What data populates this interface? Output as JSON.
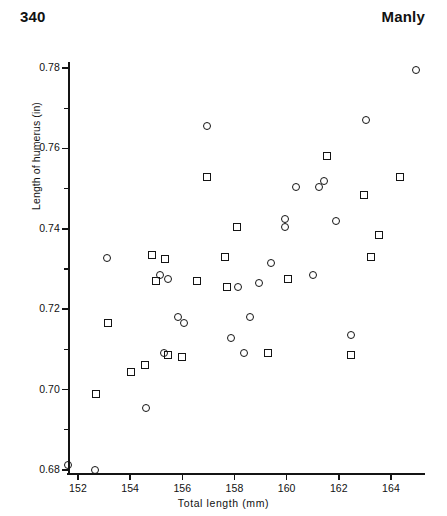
{
  "runhead": {
    "page_number": "340",
    "author": "Manly"
  },
  "chart_data": {
    "type": "scatter",
    "title": "",
    "xlabel": "Total  length  (mm)",
    "ylabel": "Length of humerus (in)",
    "xlim": [
      151.2,
      165.5
    ],
    "ylim": [
      0.6755,
      0.7855
    ],
    "grid": false,
    "legend": "none",
    "xticks": [
      152,
      154,
      156,
      158,
      160,
      162,
      164
    ],
    "xticklabels": [
      "152",
      "154",
      "156",
      "158",
      "160",
      "162",
      "164"
    ],
    "yticks": [
      0.68,
      0.7,
      0.72,
      0.74,
      0.76,
      0.78
    ],
    "yticklabels": [
      "0.68",
      "0.70",
      "0.72",
      "0.74",
      "0.76",
      "0.78"
    ],
    "y_minor_ticks": [
      0.69,
      0.71,
      0.73,
      0.75,
      0.77
    ],
    "marker_types": [
      "circle",
      "square"
    ],
    "series": [
      {
        "name": "circle",
        "marker": "circle",
        "points": [
          [
            151.6,
            0.6813
          ],
          [
            152.65,
            0.68
          ],
          [
            154.6,
            0.6953
          ],
          [
            153.1,
            0.7328
          ],
          [
            155.45,
            0.7275
          ],
          [
            155.15,
            0.7285
          ],
          [
            155.85,
            0.718
          ],
          [
            156.05,
            0.7165
          ],
          [
            155.3,
            0.709
          ],
          [
            156.95,
            0.7655
          ],
          [
            157.85,
            0.7128
          ],
          [
            158.6,
            0.718
          ],
          [
            158.15,
            0.7255
          ],
          [
            158.95,
            0.7265
          ],
          [
            159.4,
            0.7315
          ],
          [
            159.95,
            0.7405
          ],
          [
            159.95,
            0.7425
          ],
          [
            160.35,
            0.7505
          ],
          [
            161.0,
            0.7285
          ],
          [
            161.25,
            0.7505
          ],
          [
            161.45,
            0.752
          ],
          [
            161.9,
            0.742
          ],
          [
            162.45,
            0.7135
          ],
          [
            163.05,
            0.767
          ],
          [
            164.95,
            0.7795
          ],
          [
            158.35,
            0.709
          ]
        ]
      },
      {
        "name": "square",
        "marker": "square",
        "points": [
          [
            152.7,
            0.699
          ],
          [
            153.15,
            0.7165
          ],
          [
            154.05,
            0.7045
          ],
          [
            154.55,
            0.706
          ],
          [
            154.85,
            0.7335
          ],
          [
            155.35,
            0.7325
          ],
          [
            155.45,
            0.7085
          ],
          [
            155.0,
            0.727
          ],
          [
            156.0,
            0.708
          ],
          [
            156.55,
            0.727
          ],
          [
            156.95,
            0.753
          ],
          [
            157.65,
            0.733
          ],
          [
            157.7,
            0.7255
          ],
          [
            158.1,
            0.7405
          ],
          [
            159.3,
            0.709
          ],
          [
            160.05,
            0.7275
          ],
          [
            161.55,
            0.758
          ],
          [
            162.45,
            0.7085
          ],
          [
            162.95,
            0.7485
          ],
          [
            163.25,
            0.733
          ],
          [
            163.55,
            0.7385
          ],
          [
            164.35,
            0.753
          ]
        ]
      }
    ]
  }
}
